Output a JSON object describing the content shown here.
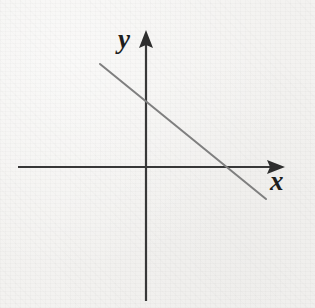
{
  "figure": {
    "kind": "coordinate-plane-line-graph",
    "width": 315,
    "height": 308,
    "background_color": "#f3f2f0",
    "axis_color": "#383838",
    "line_color": "#7f7f7f",
    "label_color": "#1e1e1e"
  },
  "axes": {
    "origin": {
      "x": 146,
      "y": 167
    },
    "x_axis": {
      "label": "x",
      "icon": "arrow-right-icon",
      "start": {
        "x": 18,
        "y": 167
      },
      "end": {
        "x": 285,
        "y": 167
      },
      "arrowhead": "solid-triangle-right",
      "stroke_width": 2.2
    },
    "y_axis": {
      "label": "y",
      "icon": "arrow-up-icon",
      "start": {
        "x": 146,
        "y": 301
      },
      "end": {
        "x": 146,
        "y": 30
      },
      "arrowhead": "solid-triangle-up",
      "stroke_width": 2.2
    }
  },
  "chart_data": {
    "type": "line",
    "title": "",
    "xlabel": "x",
    "ylabel": "y",
    "grid": false,
    "legend": "none",
    "axis_style": "arrow-terminated-cartesian-axes",
    "tick_labels": {
      "x": [],
      "y": []
    },
    "series": [
      {
        "name": "line",
        "description": "straight line with negative slope crossing both axes",
        "stroke_color": "#7f7f7f",
        "stroke_width": 2.0,
        "pixel_endpoints": [
          {
            "x": 100,
            "y": 64
          },
          {
            "x": 266,
            "y": 199
          }
        ],
        "pixel_intercepts": {
          "y_axis_crossing": {
            "x": 146,
            "y": 103
          },
          "x_axis_crossing": {
            "x": 224,
            "y": 167
          }
        },
        "graph_coordinates": {
          "note": "values in axis units inferred from pixel geometry, origin at (0,0)",
          "x": [
            -46,
            78
          ],
          "y": [
            103,
            -32
          ],
          "y_intercept": 64,
          "x_intercept": 78,
          "slope": -0.813
        }
      }
    ],
    "xlim": [
      -128,
      139
    ],
    "ylim": [
      -134,
      137
    ]
  }
}
